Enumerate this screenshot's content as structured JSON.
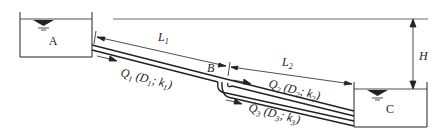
{
  "diagram": {
    "tanks": [
      {
        "id": "A",
        "label": "A"
      },
      {
        "id": "C",
        "label": "C"
      }
    ],
    "junction": {
      "label": "B"
    },
    "lengths": [
      {
        "label": "L",
        "sub": "1"
      },
      {
        "label": "L",
        "sub": "2"
      }
    ],
    "head": {
      "label": "H"
    },
    "pipes": [
      {
        "q": "Q",
        "qsub": "1",
        "d": "D",
        "dsub": "1",
        "k": "k",
        "ksub": "1"
      },
      {
        "q": "Q",
        "qsub": "2",
        "d": "D",
        "dsub": "2",
        "k": "k",
        "ksub": "2"
      },
      {
        "q": "Q",
        "qsub": "3",
        "d": "D",
        "dsub": "3",
        "k": "k",
        "ksub": "3"
      }
    ],
    "colors": {
      "line": "#222222",
      "background": "#ffffff"
    }
  }
}
